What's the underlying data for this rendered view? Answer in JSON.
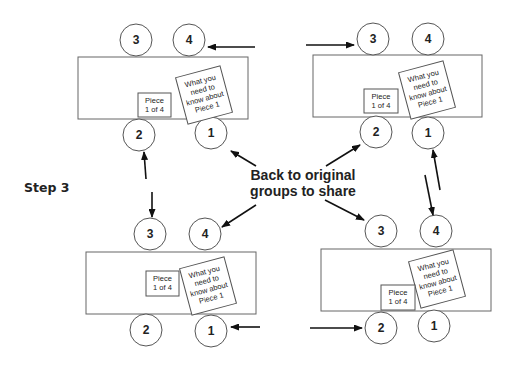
{
  "step_label": "Step 3",
  "center_label": {
    "line1": "Back to original",
    "line2": "groups to share"
  },
  "groups": [
    {
      "name": "top-left",
      "seats": [
        "3",
        "4",
        "2",
        "1"
      ],
      "piece_card": {
        "line1": "Piece",
        "line2": "1 of 4"
      },
      "note_card": {
        "line1": "What you",
        "line2": "need to",
        "line3": "know about",
        "line4": "Piece 1"
      }
    },
    {
      "name": "top-right",
      "seats": [
        "3",
        "4",
        "2",
        "1"
      ],
      "piece_card": {
        "line1": "Piece",
        "line2": "1 of 4"
      },
      "note_card": {
        "line1": "What you",
        "line2": "need to",
        "line3": "know about",
        "line4": "Piece 1"
      }
    },
    {
      "name": "bottom-left",
      "seats": [
        "3",
        "4",
        "2",
        "1"
      ],
      "piece_card": {
        "line1": "Piece",
        "line2": "1 of 4"
      },
      "note_card": {
        "line1": "What you",
        "line2": "need to",
        "line3": "know about",
        "line4": "Piece 1"
      }
    },
    {
      "name": "bottom-right",
      "seats": [
        "3",
        "4",
        "2",
        "1"
      ],
      "piece_card": {
        "line1": "Piece",
        "line2": "1 of 4"
      },
      "note_card": {
        "line1": "What you",
        "line2": "need to",
        "line3": "know about",
        "line4": "Piece 1"
      }
    }
  ]
}
